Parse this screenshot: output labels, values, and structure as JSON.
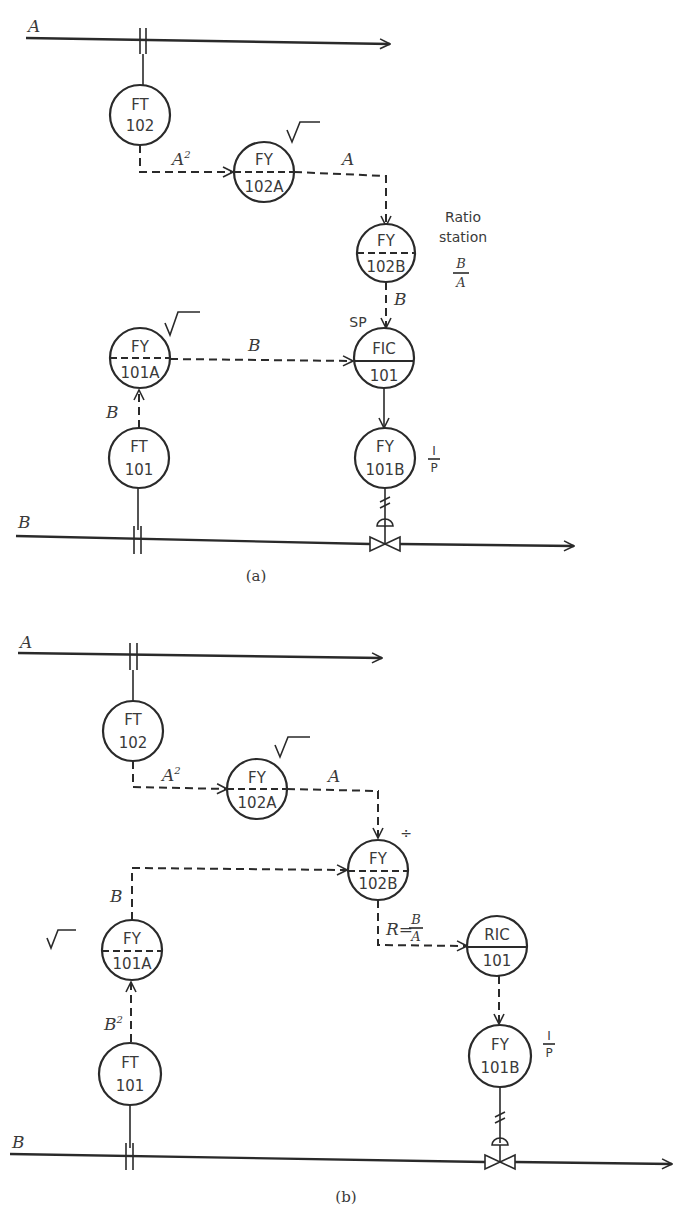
{
  "diagram_a": {
    "caption": "(a)",
    "stream_a_label": "A",
    "stream_b_label": "B",
    "instruments": {
      "ft102": {
        "top": "FT",
        "bottom": "102"
      },
      "fy102a": {
        "top": "FY",
        "bottom": "102A"
      },
      "fy102b": {
        "top": "FY",
        "bottom": "102B"
      },
      "fy101a": {
        "top": "FY",
        "bottom": "101A"
      },
      "fic101": {
        "top": "FIC",
        "bottom": "101"
      },
      "ft101": {
        "top": "FT",
        "bottom": "101"
      },
      "fy101b": {
        "top": "FY",
        "bottom": "101B"
      }
    },
    "signals": {
      "a_squared": "A",
      "a_squared_sup": "2",
      "a_out": "A",
      "b_to_fic": "B",
      "b_from_ft": "B",
      "b_setpoint": "B"
    },
    "annotations": {
      "ratio_station_line1": "Ratio",
      "ratio_station_line2": "station",
      "ratio_num": "B",
      "ratio_den": "A",
      "sp_label": "SP",
      "ip_num": "I",
      "ip_den": "P"
    }
  },
  "diagram_b": {
    "caption": "(b)",
    "stream_a_label": "A",
    "stream_b_label": "B",
    "instruments": {
      "ft102": {
        "top": "FT",
        "bottom": "102"
      },
      "fy102a": {
        "top": "FY",
        "bottom": "102A"
      },
      "fy102b": {
        "top": "FY",
        "bottom": "102B"
      },
      "fy101a": {
        "top": "FY",
        "bottom": "101A"
      },
      "ric101": {
        "top": "RIC",
        "bottom": "101"
      },
      "ft101": {
        "top": "FT",
        "bottom": "101"
      },
      "fy101b": {
        "top": "FY",
        "bottom": "101B"
      }
    },
    "signals": {
      "a_squared": "A",
      "a_squared_sup": "2",
      "a_out": "A",
      "b_out": "B",
      "b_squared": "B",
      "b_squared_sup": "2",
      "ratio_r": "R=",
      "ratio_num": "B",
      "ratio_den": "A"
    },
    "annotations": {
      "divide_symbol": "÷",
      "ip_num": "I",
      "ip_den": "P"
    }
  }
}
